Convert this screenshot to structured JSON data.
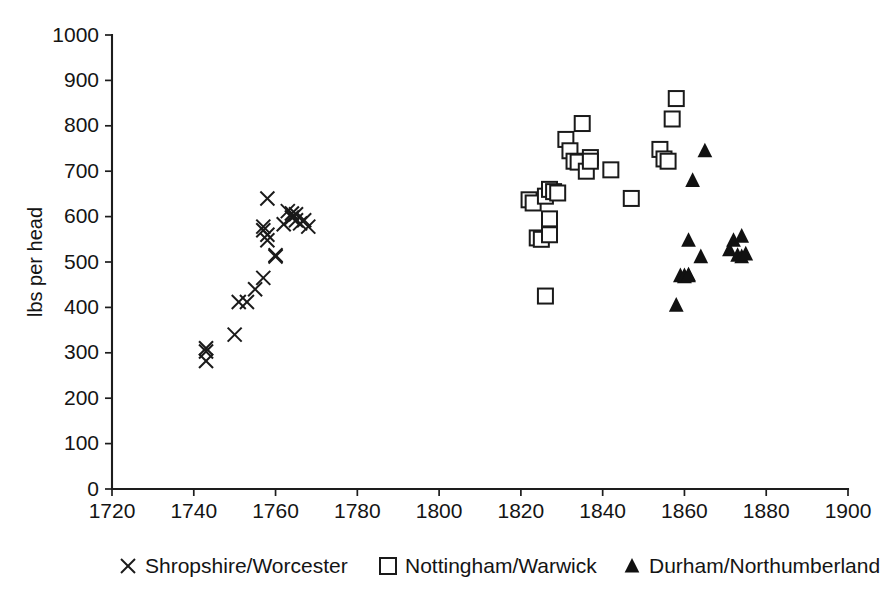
{
  "chart_data": {
    "type": "scatter",
    "title": "",
    "subtitle": "",
    "xlabel": "",
    "ylabel": "lbs per head",
    "xlim": [
      1720,
      1900
    ],
    "ylim": [
      0,
      1000
    ],
    "xticks": [
      1720,
      1740,
      1760,
      1780,
      1800,
      1820,
      1840,
      1860,
      1880,
      1900
    ],
    "yticks": [
      0,
      100,
      200,
      300,
      400,
      500,
      600,
      700,
      800,
      900,
      1000
    ],
    "grid": false,
    "legend_position": "bottom",
    "series": [
      {
        "name": "Shropshire/Worcester",
        "marker": "x",
        "marker_color": "#1a1a1a",
        "points": [
          [
            1743,
            310
          ],
          [
            1743,
            303
          ],
          [
            1743,
            282
          ],
          [
            1750,
            340
          ],
          [
            1751,
            412
          ],
          [
            1753,
            412
          ],
          [
            1755,
            440
          ],
          [
            1757,
            465
          ],
          [
            1758,
            640
          ],
          [
            1757,
            578
          ],
          [
            1757,
            570
          ],
          [
            1758,
            560
          ],
          [
            1758,
            548
          ],
          [
            1760,
            515
          ],
          [
            1760,
            512
          ],
          [
            1762,
            583
          ],
          [
            1763,
            612
          ],
          [
            1764,
            607
          ],
          [
            1764,
            598
          ],
          [
            1765,
            592
          ],
          [
            1765,
            605
          ],
          [
            1766,
            585
          ],
          [
            1767,
            592
          ],
          [
            1768,
            578
          ]
        ]
      },
      {
        "name": "Nottingham/Warwick",
        "marker": "square",
        "marker_color": "#1a1a1a",
        "points": [
          [
            1822,
            637
          ],
          [
            1823,
            630
          ],
          [
            1824,
            553
          ],
          [
            1825,
            550
          ],
          [
            1826,
            645
          ],
          [
            1826,
            425
          ],
          [
            1827,
            660
          ],
          [
            1827,
            595
          ],
          [
            1827,
            560
          ],
          [
            1828,
            655
          ],
          [
            1829,
            652
          ],
          [
            1831,
            770
          ],
          [
            1832,
            745
          ],
          [
            1833,
            722
          ],
          [
            1834,
            720
          ],
          [
            1835,
            805
          ],
          [
            1836,
            700
          ],
          [
            1837,
            730
          ],
          [
            1837,
            722
          ],
          [
            1842,
            703
          ],
          [
            1847,
            640
          ],
          [
            1854,
            748
          ],
          [
            1855,
            727
          ],
          [
            1856,
            722
          ],
          [
            1857,
            815
          ],
          [
            1858,
            860
          ]
        ]
      },
      {
        "name": "Durham/Northumberland",
        "marker": "triangle",
        "marker_color": "#111111",
        "points": [
          [
            1858,
            405
          ],
          [
            1859,
            470
          ],
          [
            1860,
            468
          ],
          [
            1860,
            470
          ],
          [
            1861,
            472
          ],
          [
            1861,
            470
          ],
          [
            1861,
            548
          ],
          [
            1862,
            680
          ],
          [
            1864,
            512
          ],
          [
            1865,
            745
          ],
          [
            1871,
            527
          ],
          [
            1872,
            548
          ],
          [
            1873,
            515
          ],
          [
            1874,
            512
          ],
          [
            1874,
            557
          ],
          [
            1875,
            518
          ]
        ]
      }
    ]
  },
  "legend": {
    "items": [
      {
        "label": "Shropshire/Worcester",
        "marker": "x"
      },
      {
        "label": "Nottingham/Warwick",
        "marker": "square"
      },
      {
        "label": "Durham/Northumberland",
        "marker": "triangle"
      }
    ]
  }
}
